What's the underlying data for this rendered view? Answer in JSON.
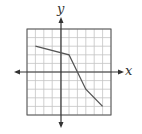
{
  "chart_data": {
    "type": "line",
    "title": "",
    "xlabel": "x",
    "ylabel": "y",
    "xlim": [
      -4,
      6
    ],
    "ylim": [
      -5,
      5
    ],
    "grid": true,
    "x": [
      -3,
      1,
      3,
      5
    ],
    "y": [
      3,
      2,
      -2,
      -4
    ],
    "series": [
      {
        "name": "piecewise line",
        "points": [
          [
            -3,
            3
          ],
          [
            1,
            2
          ],
          [
            3,
            -2
          ],
          [
            5,
            -4
          ]
        ]
      }
    ],
    "colors": {
      "line": "#555555",
      "grid": "#bbbbbb",
      "axis": "#333333"
    }
  },
  "labels": {
    "x_axis": "x",
    "y_axis": "y"
  }
}
